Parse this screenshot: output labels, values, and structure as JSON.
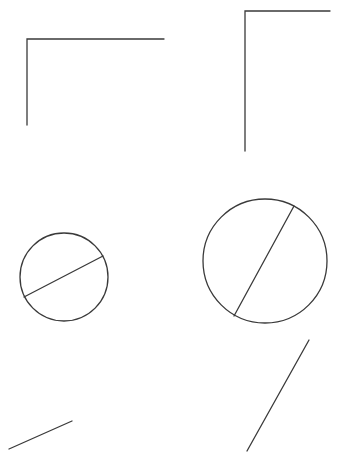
{
  "canvas": {
    "width": 339,
    "height": 466,
    "background": "#ffffff"
  },
  "style": {
    "stroke": "#3a3a3a",
    "stroke_width": 1.3
  },
  "shapes": {
    "corner_small": {
      "points": "27,125 27,39 164,39"
    },
    "corner_large": {
      "points": "245,151 245,11 330,11"
    },
    "circle_small": {
      "cx": 64,
      "cy": 277,
      "r": 44,
      "diameter": {
        "x1": 24,
        "y1": 297,
        "x2": 103,
        "y2": 256
      }
    },
    "circle_large": {
      "cx": 265,
      "cy": 261,
      "r": 62,
      "diameter": {
        "x1": 294,
        "y1": 206,
        "x2": 234,
        "y2": 316
      }
    },
    "segment_short": {
      "x1": 9,
      "y1": 449,
      "x2": 72,
      "y2": 421
    },
    "segment_long": {
      "x1": 309,
      "y1": 340,
      "x2": 247,
      "y2": 451
    }
  }
}
